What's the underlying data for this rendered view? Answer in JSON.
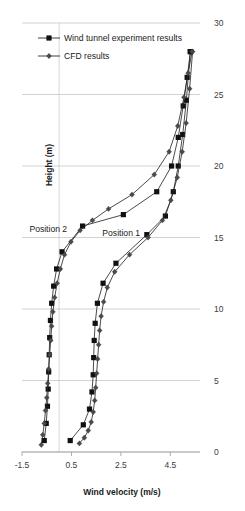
{
  "chart_data": {
    "type": "line",
    "title": "",
    "xlabel": "Wind velocity (m/s)",
    "ylabel": "Height (m)",
    "xlim": [
      -1.5,
      5.7
    ],
    "ylim": [
      0,
      30
    ],
    "xticks": [
      -1.5,
      0.5,
      2.5,
      4.5
    ],
    "xtick_labels": [
      "-1.5",
      "0.5",
      "2.5",
      "4.5"
    ],
    "yticks": [
      0,
      5,
      10,
      15,
      20,
      25,
      30
    ],
    "ytick_labels": [
      "0",
      "5",
      "10",
      "15",
      "20",
      "25",
      "30"
    ],
    "y_axis_position": "right",
    "grid": "horizontal",
    "legend_position": "top-left",
    "legend": [
      {
        "name": "Wind tunnel experiment results",
        "marker": "square",
        "color": "#111111"
      },
      {
        "name": "CFD results",
        "marker": "diamond",
        "color": "#4a4a4a"
      }
    ],
    "annotations": [
      {
        "text": "Position 2",
        "x": -1.2,
        "y": 15.4
      },
      {
        "text": "Position 1",
        "x": 1.75,
        "y": 15.1
      }
    ],
    "series": [
      {
        "name": "Position 1 - Wind tunnel experiment results",
        "marker": "square",
        "x": [
          0.45,
          0.98,
          1.23,
          1.33,
          1.38,
          1.4,
          1.42,
          1.46,
          1.55,
          1.78,
          2.3,
          3.55,
          4.3,
          4.62,
          4.82,
          5.0,
          5.15,
          5.3
        ],
        "y": [
          0.8,
          1.9,
          3.0,
          4.2,
          5.4,
          6.6,
          7.8,
          9.0,
          10.4,
          11.8,
          13.2,
          15.2,
          16.5,
          18.2,
          20.0,
          22.2,
          24.6,
          28.0
        ]
      },
      {
        "name": "Position 1 - CFD results",
        "marker": "diamond",
        "x": [
          0.82,
          1.02,
          1.18,
          1.3,
          1.38,
          1.44,
          1.48,
          1.52,
          1.56,
          1.6,
          1.64,
          1.7,
          1.8,
          1.95,
          2.25,
          2.85,
          3.6,
          4.18,
          4.52,
          4.78,
          4.98,
          5.14,
          5.28,
          5.4
        ],
        "y": [
          0.6,
          1.0,
          1.5,
          2.1,
          2.8,
          3.6,
          4.5,
          5.5,
          6.5,
          7.5,
          8.5,
          9.5,
          10.5,
          11.5,
          12.6,
          13.8,
          15.0,
          16.2,
          17.6,
          19.2,
          21.0,
          23.0,
          25.4,
          28.0
        ]
      },
      {
        "name": "Position 2 - Wind tunnel experiment results",
        "marker": "square",
        "x": [
          -0.6,
          -0.52,
          -0.47,
          -0.44,
          -0.42,
          -0.4,
          -0.38,
          -0.35,
          -0.3,
          -0.22,
          -0.1,
          0.12,
          0.95,
          2.6,
          3.95,
          4.55,
          4.82,
          5.02,
          5.18,
          5.32
        ],
        "y": [
          0.8,
          2.0,
          3.2,
          4.4,
          5.6,
          6.8,
          8.0,
          9.2,
          10.4,
          11.6,
          12.8,
          14.0,
          15.8,
          16.6,
          18.2,
          20.0,
          22.0,
          24.2,
          26.2,
          28.0
        ]
      },
      {
        "name": "Position 2 - CFD results",
        "marker": "diamond",
        "x": [
          -0.72,
          -0.66,
          -0.6,
          -0.55,
          -0.5,
          -0.46,
          -0.42,
          -0.38,
          -0.34,
          -0.3,
          -0.25,
          -0.18,
          -0.08,
          0.05,
          0.22,
          0.48,
          0.85,
          1.35,
          2.0,
          2.95,
          3.85,
          4.45,
          4.8,
          5.05,
          5.22,
          5.38
        ],
        "y": [
          0.5,
          1.2,
          2.0,
          2.9,
          3.8,
          4.8,
          5.8,
          6.8,
          7.8,
          8.8,
          9.8,
          10.8,
          11.8,
          12.8,
          13.8,
          14.7,
          15.5,
          16.2,
          17.0,
          18.0,
          19.4,
          21.0,
          22.8,
          24.8,
          26.5,
          28.0
        ]
      }
    ]
  }
}
